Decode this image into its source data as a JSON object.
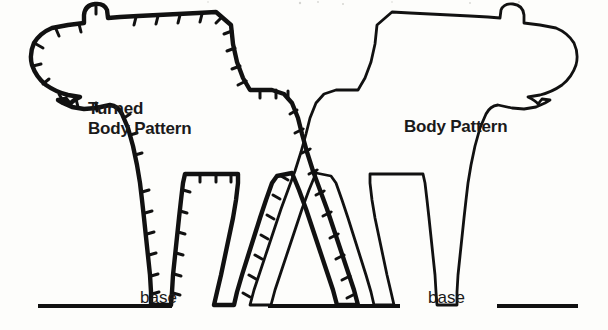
{
  "page": {
    "background_color": "#fdfdfb",
    "ink_color": "#111111",
    "width": 608,
    "height": 330
  },
  "labels": {
    "turned_line1": "Turned",
    "turned_line2": "Body Pattern",
    "body_pattern": "Body Pattern",
    "base_left": "base",
    "base_right": "base"
  },
  "figures": [
    {
      "id": "turned-body-pattern",
      "name": "Turned Body Pattern",
      "facing": "left",
      "has_seam_allowance_ticks": true,
      "stroke_width": 4.2,
      "tick_count": 46,
      "outline_points": "216,13 230,22 233,41 237,60 246,75 262,90 292,90 300,94 310,106 318,123 321,140 327,162 334,186 340,208 348,232 356,256 364,280 369,296 372,305 352,305 344,292 336,272 328,250 321,230 313,208 306,189 300,173 295,174 288,176 283,178 279,180 277,182 272,191 268,203 262,219 256,236 250,252 244,268 238,285 234,297 232,305 211,305 213,296 216,284 220,268 224,250 229,231 233,212 237,194 240,178 240,174 186,174 185,181 183,196 181,213 179,232 177,252 176,272 175,290 174,305 155,305 155,290 153,272 151,252 149,232 147,213 145,196 143,180 141,163 138,146 134,130 130,116 126,104 121,97 112,94 104,95 95,97 86,98 75,98 64,96 54,92 45,86 38,78 33,68 31,57 33,46 39,37 47,31 57,27 68,25 78,24 86,22 89,19 88,7 92,3 99,2 106,5 110,11 110,18 111,24 120,22 133,20 148,18 165,16 182,15 200,14 216,13",
      "base_line": {
        "x1": 38,
        "y1": 305,
        "x2": 138,
        "y2": 305,
        "x3": 220,
        "y3": 305
      },
      "base_line_2": {
        "x1": 232,
        "y1": 305,
        "x2": 340,
        "y2": 305
      }
    },
    {
      "id": "body-pattern",
      "name": "Body Pattern",
      "facing": "right",
      "has_seam_allowance_ticks": false,
      "stroke_width": 2.6,
      "tick_count": 0,
      "outline_points": "392,13 378,22 375,41 371,60 362,75 346,90 316,90 308,94 298,106 290,123 287,140 281,162 274,186 268,208 260,232 252,256 244,280 239,296 236,305 256,305 264,292 272,272 280,250 287,230 295,208 302,189 308,173 313,174 320,176 325,178 329,180 331,182 336,191 340,203 346,219 352,236 358,252 364,268 370,285 374,297 376,305 397,305 395,296 392,284 388,268 384,250 379,231 375,212 371,194 368,178 368,174 422,174 423,181 425,196 427,213 429,232 431,252 432,272 433,290 434,305 453,305 453,290 455,272 457,252 459,232 461,213 463,196 465,180 467,163 470,146 474,130 478,116 482,104 487,97 496,94 504,95 513,97 522,98 533,98 544,96 554,92 563,86 570,78 575,68 577,57 575,46 569,37 561,31 551,27 540,25 530,24 522,22 519,19 520,7 516,3 509,2 502,5 498,11 498,18 497,24 488,22 475,20 460,18 443,16 426,15 408,14 392,13",
      "base_line": {
        "x1": 268,
        "y1": 305,
        "x2": 400,
        "y2": 305
      },
      "base_line_2": {
        "x1": 520,
        "y1": 305,
        "x2": 595,
        "y2": 305
      }
    }
  ]
}
